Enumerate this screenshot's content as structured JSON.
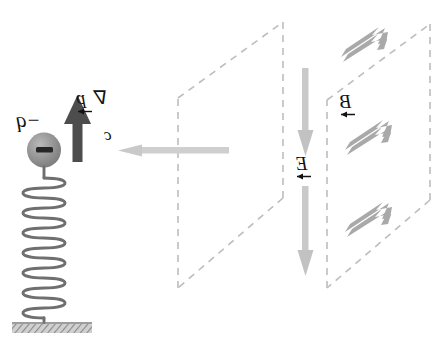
{
  "figure": {
    "orientation": "mirrored-horizontally",
    "width": 436,
    "height": 346,
    "background": "#ffffff"
  },
  "labels": {
    "charge": "−q",
    "charge_sign": "−",
    "dipole_moment": "p",
    "dipole_nabla": "∇",
    "speed_of_light": "c",
    "electric_field": "E",
    "magnetic_field": "B"
  },
  "elements": {
    "oscillator": {
      "name": "charged-mass-on-spring",
      "charge_label": "−q",
      "sphere_color": "#8e8e8e",
      "spring_color": "#707070",
      "spring_turns": 12,
      "ground_color": "#9a9a9a"
    },
    "dipole_arrow": {
      "name": "dipole-moment-arrow",
      "direction": "up",
      "color": "#4d4d4d",
      "label": "p"
    },
    "propagation_arrow": {
      "name": "propagation-direction-arrow",
      "direction": "left",
      "color": "#cfcfcf",
      "label": "c"
    },
    "e_field_arrow": {
      "name": "electric-field-arrow",
      "direction": "down",
      "color": "#c6c6c6",
      "label": "E",
      "count": 2
    },
    "b_field_arrows": {
      "name": "magnetic-field-arrows",
      "direction": "up-right",
      "color": "#a8a8a8",
      "label": "B",
      "count": 3
    },
    "wavefront_planes": {
      "name": "dashed-wavefront-planes",
      "count": 2,
      "style": "dashed",
      "color": "#bdbdbd"
    }
  },
  "colors": {
    "ink": "#121212",
    "light_gray": "#c6c6c6",
    "mid_gray": "#a8a8a8",
    "dark_gray": "#4d4d4d",
    "dash_gray": "#bdbdbd",
    "sphere_gray": "#8e8e8e"
  }
}
